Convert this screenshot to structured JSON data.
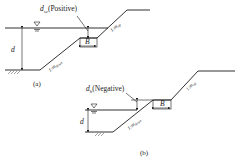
{
  "figure_a": {
    "caption": "(a)",
    "submergence_label": "d",
    "submergence_sub": "sc",
    "submergence_note": "(Positive)",
    "depth_label": "d",
    "berm_width_label": "B",
    "slope_down_prefix": "1:",
    "slope_down_m": "m",
    "slope_down_sub": "down",
    "slope_up_prefix": "1:",
    "slope_up_m": "m",
    "slope_up_sub": "up"
  },
  "figure_b": {
    "caption": "(b)",
    "submergence_label": "d",
    "submergence_sub": "h",
    "submergence_note": "(Negative)",
    "depth_label": "d",
    "berm_width_label": "B",
    "slope_down_prefix": "1:",
    "slope_down_m": "m",
    "slope_down_sub": "down",
    "slope_up_prefix": "1:",
    "slope_up_m": "m",
    "slope_up_sub": "up"
  }
}
